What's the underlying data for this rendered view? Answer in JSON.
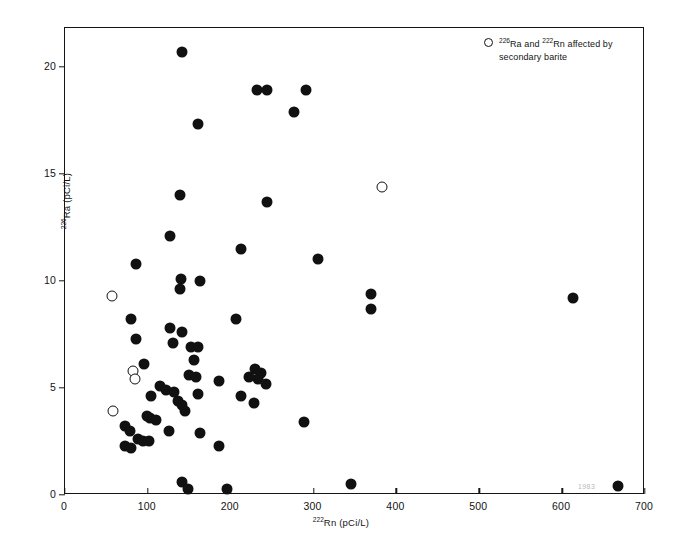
{
  "chart_data": {
    "type": "scatter",
    "title": "",
    "xlabel": "222 Rn (pCi/L)",
    "ylabel": "226 Ra (pCi/L)",
    "xlabel_iso": "222",
    "xlabel_elem": "Rn (pCi/L)",
    "ylabel_iso": "226",
    "ylabel_elem": "Ra (pCi/L)",
    "xlim": [
      0,
      700
    ],
    "ylim": [
      0,
      21.8
    ],
    "xticks": [
      0,
      100,
      200,
      300,
      400,
      500,
      600,
      700
    ],
    "yticks": [
      0,
      5,
      10,
      15,
      20
    ],
    "grid": false,
    "legend_position": "top-right",
    "series": [
      {
        "name": "normal samples",
        "marker": "filled-circle",
        "color": "#111111",
        "points": [
          [
            141,
            20.7
          ],
          [
            232,
            18.9
          ],
          [
            244,
            18.9
          ],
          [
            291,
            18.9
          ],
          [
            276,
            17.9
          ],
          [
            160,
            17.3
          ],
          [
            139,
            14.0
          ],
          [
            244,
            13.7
          ],
          [
            127,
            12.1
          ],
          [
            212,
            11.5
          ],
          [
            305,
            11.0
          ],
          [
            86,
            10.8
          ],
          [
            140,
            10.1
          ],
          [
            163,
            10.0
          ],
          [
            139,
            9.6
          ],
          [
            369,
            9.4
          ],
          [
            613,
            9.2
          ],
          [
            369,
            8.7
          ],
          [
            80,
            8.2
          ],
          [
            206,
            8.2
          ],
          [
            127,
            7.8
          ],
          [
            141,
            7.6
          ],
          [
            86,
            7.3
          ],
          [
            130,
            7.1
          ],
          [
            152,
            6.9
          ],
          [
            161,
            6.9
          ],
          [
            156,
            6.3
          ],
          [
            95,
            6.1
          ],
          [
            229,
            5.9
          ],
          [
            236,
            5.7
          ],
          [
            150,
            5.6
          ],
          [
            158,
            5.5
          ],
          [
            222,
            5.5
          ],
          [
            233,
            5.4
          ],
          [
            186,
            5.3
          ],
          [
            243,
            5.2
          ],
          [
            115,
            5.1
          ],
          [
            122,
            4.9
          ],
          [
            131,
            4.8
          ],
          [
            160,
            4.7
          ],
          [
            213,
            4.6
          ],
          [
            104,
            4.6
          ],
          [
            136,
            4.4
          ],
          [
            228,
            4.3
          ],
          [
            141,
            4.2
          ],
          [
            145,
            3.9
          ],
          [
            99,
            3.7
          ],
          [
            103,
            3.6
          ],
          [
            110,
            3.5
          ],
          [
            288,
            3.4
          ],
          [
            73,
            3.2
          ],
          [
            78,
            3.0
          ],
          [
            126,
            3.0
          ],
          [
            163,
            2.9
          ],
          [
            88,
            2.6
          ],
          [
            94,
            2.5
          ],
          [
            101,
            2.5
          ],
          [
            72,
            2.3
          ],
          [
            186,
            2.3
          ],
          [
            80,
            2.2
          ],
          [
            141,
            0.6
          ],
          [
            148,
            0.3
          ],
          [
            196,
            0.3
          ],
          [
            345,
            0.5
          ],
          [
            667,
            0.4
          ]
        ]
      },
      {
        "name": "226 Ra and 222 Rn affected by secondary barite",
        "marker": "open-circle",
        "color": "#111111",
        "points": [
          [
            57,
            9.3
          ],
          [
            383,
            14.4
          ],
          [
            82,
            5.8
          ],
          [
            85,
            5.4
          ],
          [
            58,
            3.9
          ]
        ]
      }
    ],
    "annotations": [
      {
        "text": "1983",
        "x_px": 585,
        "y_px": 489,
        "note": "faint scan artifact near lower right"
      }
    ]
  },
  "legend": {
    "marker_icon": "open-circle-icon",
    "line1_iso1": "226",
    "line1_mid1": "Ra and",
    "line1_iso2": "222",
    "line1_mid2": "Rn affected by",
    "line2": "secondary barite"
  },
  "axes": {
    "x_tick_labels": [
      "0",
      "100",
      "200",
      "300",
      "400",
      "500",
      "600",
      "700"
    ],
    "y_tick_labels": [
      "0",
      "5",
      "10",
      "15",
      "20"
    ]
  },
  "artifact": {
    "text": "1983"
  }
}
